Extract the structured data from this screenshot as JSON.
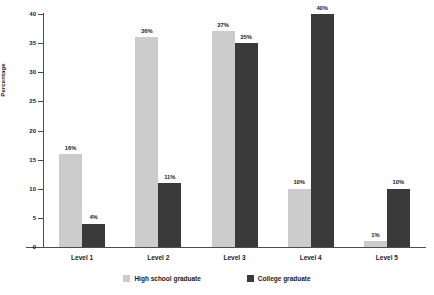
{
  "chart_data": {
    "type": "bar",
    "title": "",
    "xlabel": "",
    "ylabel": "Percentage",
    "ylim": [
      0,
      40
    ],
    "ytick_labels": [
      "0",
      "5",
      "10",
      "15",
      "20",
      "25",
      "30",
      "35",
      "40"
    ],
    "ytick_values": [
      0,
      5,
      10,
      15,
      20,
      25,
      30,
      35,
      40
    ],
    "grid": false,
    "legend_position": "bottom-center",
    "categories": [
      "Level 1",
      "Level 2",
      "Level 3",
      "Level 4",
      "Level 5"
    ],
    "series": [
      {
        "name": "High school graduate",
        "color": "#cccccc",
        "values": [
          16,
          36,
          37,
          10,
          1
        ],
        "data_labels": [
          "16%",
          "36%",
          "37%",
          "10%",
          "1%"
        ]
      },
      {
        "name": "College graduate",
        "color": "#3a3a3a",
        "values": [
          4,
          11,
          35,
          40,
          10
        ],
        "data_labels": [
          "4%",
          "11%",
          "35%",
          "40%",
          "10%"
        ]
      }
    ]
  },
  "axis": {
    "y_title": "Percentage"
  },
  "legend": {
    "items": [
      {
        "label": "High school graduate",
        "color": "#cccccc"
      },
      {
        "label": "College graduate",
        "color": "#3a3a3a"
      }
    ]
  },
  "colors": {
    "high_school": "#cccccc",
    "college": "#3a3a3a",
    "axis": "#4d4d4d",
    "text": "#1a1a1a",
    "background": "#ffffff"
  }
}
